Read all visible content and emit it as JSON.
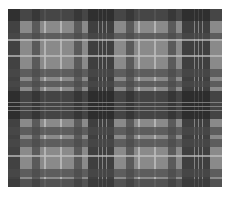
{
  "image": {
    "description": "Grayscale tartan plaid fabric swatch",
    "colors": {
      "background": "#ffffff",
      "base": "#8a8a8a",
      "dark": "#2a2a2a",
      "mid": "#4a4a4a",
      "light": "#b5b5b5"
    },
    "vertical_bands": [
      {
        "x": 0,
        "w": 12,
        "c": "#2a2a2a"
      },
      {
        "x": 24,
        "w": 8,
        "c": "#4a4a4a"
      },
      {
        "x": 36,
        "w": 2,
        "c": "#c0c0c0"
      },
      {
        "x": 52,
        "w": 2,
        "c": "#c0c0c0"
      },
      {
        "x": 66,
        "w": 8,
        "c": "#4a4a4a"
      },
      {
        "x": 80,
        "w": 26,
        "c": "#262626"
      },
      {
        "x": 90,
        "w": 1,
        "c": "#9a9a9a"
      },
      {
        "x": 94,
        "w": 1,
        "c": "#9a9a9a"
      },
      {
        "x": 98,
        "w": 1,
        "c": "#9a9a9a"
      },
      {
        "x": 118,
        "w": 8,
        "c": "#4a4a4a"
      },
      {
        "x": 130,
        "w": 2,
        "c": "#c0c0c0"
      },
      {
        "x": 146,
        "w": 2,
        "c": "#c0c0c0"
      },
      {
        "x": 160,
        "w": 8,
        "c": "#4a4a4a"
      },
      {
        "x": 174,
        "w": 28,
        "c": "#262626"
      },
      {
        "x": 186,
        "w": 1,
        "c": "#9a9a9a"
      },
      {
        "x": 190,
        "w": 1,
        "c": "#9a9a9a"
      },
      {
        "x": 194,
        "w": 1,
        "c": "#9a9a9a"
      }
    ],
    "horizontal_bands": [
      {
        "y": 0,
        "h": 12,
        "c": "#2a2a2a"
      },
      {
        "y": 24,
        "h": 6,
        "c": "#4a4a4a"
      },
      {
        "y": 30,
        "h": 2,
        "c": "#c0c0c0"
      },
      {
        "y": 46,
        "h": 2,
        "c": "#c0c0c0"
      },
      {
        "y": 60,
        "h": 8,
        "c": "#4a4a4a"
      },
      {
        "y": 72,
        "h": 6,
        "c": "#4a4a4a"
      },
      {
        "y": 82,
        "h": 28,
        "c": "#262626"
      },
      {
        "y": 93,
        "h": 1,
        "c": "#9a9a9a"
      },
      {
        "y": 97,
        "h": 1,
        "c": "#9a9a9a"
      },
      {
        "y": 101,
        "h": 1,
        "c": "#9a9a9a"
      },
      {
        "y": 118,
        "h": 8,
        "c": "#4a4a4a"
      },
      {
        "y": 130,
        "h": 8,
        "c": "#4a4a4a"
      },
      {
        "y": 146,
        "h": 2,
        "c": "#c0c0c0"
      },
      {
        "y": 160,
        "h": 8,
        "c": "#4a4a4a"
      },
      {
        "y": 170,
        "h": 8,
        "c": "#3a3a3a"
      }
    ]
  }
}
